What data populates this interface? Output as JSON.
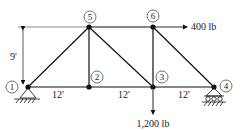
{
  "diagram": {
    "type": "truss",
    "nodes": [
      {
        "id": "1",
        "label": "1",
        "x": 28,
        "y": 87,
        "support": "pin"
      },
      {
        "id": "2",
        "label": "2",
        "x": 89,
        "y": 87
      },
      {
        "id": "3",
        "label": "3",
        "x": 153,
        "y": 87
      },
      {
        "id": "4",
        "label": "4",
        "x": 214,
        "y": 87,
        "support": "roller"
      },
      {
        "id": "5",
        "label": "5",
        "x": 89,
        "y": 27
      },
      {
        "id": "6",
        "label": "6",
        "x": 153,
        "y": 27
      }
    ],
    "members": [
      [
        "1",
        "2"
      ],
      [
        "2",
        "3"
      ],
      [
        "3",
        "4"
      ],
      [
        "5",
        "6"
      ],
      [
        "1",
        "5"
      ],
      [
        "5",
        "2"
      ],
      [
        "5",
        "3"
      ],
      [
        "6",
        "3"
      ],
      [
        "6",
        "4"
      ]
    ],
    "dimensions": {
      "height_label": "9'",
      "span_labels": [
        "12'",
        "12'",
        "12'"
      ]
    },
    "loads": {
      "horizontal": "400 lb",
      "vertical": "1,200 lb"
    }
  }
}
